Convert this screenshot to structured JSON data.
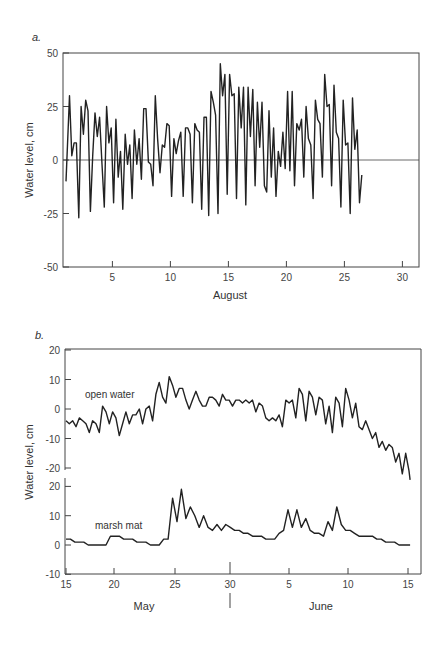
{
  "chart_data": [
    {
      "type": "line",
      "panel": "a.",
      "title": "",
      "xlabel": "August",
      "ylabel": "Water level, cm",
      "ylim": [
        -50,
        50
      ],
      "xlim": [
        1,
        31
      ],
      "y_ticks": [
        "50",
        "25",
        "0",
        "-25",
        "-50"
      ],
      "x_ticks": [
        "5",
        "10",
        "15",
        "20",
        "25",
        "30"
      ],
      "grid": false,
      "reference_line": 0,
      "series": [
        {
          "name": "water level",
          "x": [
            1.0,
            1.3,
            1.5,
            1.7,
            1.9,
            2.1,
            2.3,
            2.5,
            2.7,
            2.9,
            3.1,
            3.3,
            3.5,
            3.7,
            3.9,
            4.1,
            4.3,
            4.5,
            4.7,
            4.9,
            5.1,
            5.3,
            5.5,
            5.7,
            5.9,
            6.1,
            6.3,
            6.5,
            6.7,
            6.9,
            7.1,
            7.3,
            7.5,
            7.7,
            7.9,
            8.1,
            8.3,
            8.5,
            8.7,
            8.9,
            9.1,
            9.3,
            9.5,
            9.7,
            9.9,
            10.1,
            10.3,
            10.5,
            10.7,
            10.9,
            11.1,
            11.3,
            11.5,
            11.7,
            11.9,
            12.1,
            12.3,
            12.5,
            12.7,
            12.9,
            13.1,
            13.3,
            13.5,
            13.7,
            13.9,
            14.1,
            14.3,
            14.5,
            14.7,
            14.9,
            15.1,
            15.3,
            15.5,
            15.7,
            15.9,
            16.1,
            16.3,
            16.5,
            16.7,
            16.9,
            17.1,
            17.3,
            17.5,
            17.7,
            17.9,
            18.1,
            18.3,
            18.5,
            18.7,
            18.9,
            19.1,
            19.3,
            19.5,
            19.7,
            19.9,
            20.1,
            20.3,
            20.5,
            20.7,
            20.9,
            21.1,
            21.3,
            21.5,
            21.7,
            21.9,
            22.1,
            22.3,
            22.5,
            22.7,
            22.9,
            23.1,
            23.3,
            23.5,
            23.7,
            23.9,
            24.1,
            24.3,
            24.5,
            24.7,
            24.9,
            25.1,
            25.3,
            25.5,
            25.7,
            25.9,
            26.1,
            26.3,
            26.5,
            26.7,
            26.9,
            27.1,
            27.3,
            27.5,
            27.7,
            27.9,
            28.1,
            28.3,
            28.5,
            28.7,
            28.9,
            29.1,
            29.3,
            29.5,
            29.7,
            29.9,
            30.1,
            30.3,
            30.5,
            30.7,
            31.0
          ],
          "values": [
            -10,
            30,
            2,
            8,
            8,
            -27,
            25,
            12,
            28,
            23,
            -24,
            2,
            22,
            11,
            20,
            -2,
            -22,
            25,
            8,
            15,
            -20,
            19,
            -8,
            4,
            -23,
            12,
            -2,
            7,
            -18,
            14,
            -2,
            10,
            -9,
            24,
            24,
            -1,
            -2,
            -12,
            30,
            10,
            -6,
            7,
            6,
            17,
            16,
            -17,
            10,
            3,
            9,
            13,
            -17,
            15,
            15,
            12,
            -20,
            17,
            14,
            13,
            -23,
            20,
            20,
            -26,
            32,
            27,
            21,
            -25,
            45,
            30,
            40,
            -16,
            40,
            30,
            31,
            -18,
            34,
            15,
            34,
            -21,
            34,
            11,
            33,
            -12,
            27,
            6,
            27,
            -12,
            -15,
            23,
            -8,
            15,
            -17,
            4,
            -3,
            13,
            -4,
            32,
            -5,
            32,
            -12,
            17,
            14,
            19,
            -8,
            25,
            10,
            7,
            -18,
            28,
            19,
            17,
            -8,
            40,
            25,
            26,
            -12,
            35,
            13,
            10,
            -22,
            28,
            7,
            8,
            -25,
            29,
            5,
            14,
            -20,
            -7
          ]
        }
      ]
    },
    {
      "type": "line",
      "panel": "b.",
      "title": "",
      "xlabel": "",
      "x_group_labels": [
        "May",
        "June"
      ],
      "ylabel": "Water level, cm",
      "xlim": [
        "May 15",
        "June 15"
      ],
      "x_ticks": [
        "15",
        "20",
        "25",
        "30",
        "5",
        "10",
        "15"
      ],
      "grid": false,
      "subpanels": [
        {
          "name": "open water",
          "ylim": [
            -25,
            20
          ],
          "y_ticks": [
            "20",
            "10",
            "0",
            "-10",
            "-20"
          ]
        },
        {
          "name": "marsh mat",
          "ylim": [
            -10,
            22
          ],
          "y_ticks": [
            "20",
            "10",
            "0",
            "-10"
          ]
        }
      ],
      "series": [
        {
          "name": "open water",
          "x_day_index": [
            0,
            0.3,
            0.6,
            0.9,
            1.2,
            1.5,
            1.8,
            2.1,
            2.4,
            2.7,
            3.0,
            3.3,
            3.6,
            3.9,
            4.2,
            4.5,
            4.8,
            5.1,
            5.4,
            5.7,
            6.0,
            6.3,
            6.6,
            6.9,
            7.2,
            7.5,
            7.8,
            8.1,
            8.4,
            8.7,
            9.0,
            9.3,
            9.6,
            9.9,
            10.2,
            10.5,
            10.8,
            11.1,
            11.4,
            11.7,
            12.0,
            12.3,
            12.6,
            12.9,
            13.2,
            13.5,
            13.8,
            14.1,
            14.4,
            14.7,
            15.0,
            15.3,
            15.6,
            15.9,
            16.2,
            16.5,
            16.8,
            17.1,
            17.4,
            17.7,
            18.0,
            18.3,
            18.6,
            18.9,
            19.2,
            19.5,
            19.8,
            20.1,
            20.4,
            20.7,
            21.0,
            21.3,
            21.6,
            21.9,
            22.2,
            22.5,
            22.8,
            23.1,
            23.4,
            23.7,
            24.0,
            24.3,
            24.6,
            24.9,
            25.2,
            25.5,
            25.8,
            26.1,
            26.4,
            26.7,
            27.0,
            27.3,
            27.6,
            27.9,
            28.2,
            28.5,
            28.8,
            29.1,
            29.4,
            29.7,
            30.0,
            30.3,
            30.6,
            30.9,
            31.0
          ],
          "values": [
            -4,
            -5,
            -4,
            -6,
            -3,
            -4,
            -5,
            -8,
            -4,
            -5,
            -8,
            1,
            -1,
            -5,
            -1,
            -3,
            -9,
            -5,
            -1,
            -5,
            -2,
            -2,
            0,
            -5,
            0,
            1,
            -4,
            5,
            9,
            4,
            2,
            11,
            8,
            4,
            7,
            7,
            3,
            0,
            3,
            6,
            3,
            1,
            1,
            4,
            4,
            3,
            1,
            5,
            3,
            3,
            1,
            3,
            3,
            2,
            3,
            2,
            3,
            -1,
            2,
            1,
            -3,
            -4,
            -3,
            -4,
            -2,
            -6,
            3,
            2,
            3,
            -3,
            7,
            5,
            -4,
            6,
            4,
            -2,
            4,
            3,
            -5,
            1,
            -8,
            4,
            2,
            -6,
            7,
            3,
            -3,
            2,
            -6,
            -7,
            -4,
            -7,
            -10,
            -8,
            -13,
            -11,
            -14,
            -12,
            -13,
            -18,
            -15,
            -22,
            -15,
            -21,
            -24
          ]
        },
        {
          "name": "marsh mat",
          "x_day_index": [
            0,
            0.4,
            0.8,
            1.2,
            1.6,
            2.0,
            2.4,
            2.8,
            3.2,
            3.6,
            4.0,
            4.4,
            4.8,
            5.2,
            5.6,
            6.0,
            6.4,
            6.8,
            7.2,
            7.6,
            8.0,
            8.4,
            8.8,
            9.2,
            9.6,
            10.0,
            10.4,
            10.8,
            11.2,
            11.6,
            12.0,
            12.4,
            12.8,
            13.2,
            13.6,
            14.0,
            14.4,
            14.8,
            15.2,
            15.6,
            16.0,
            16.4,
            16.8,
            17.2,
            17.6,
            18.0,
            18.4,
            18.8,
            19.2,
            19.6,
            20.0,
            20.4,
            20.8,
            21.2,
            21.6,
            22.0,
            22.4,
            22.8,
            23.2,
            23.6,
            24.0,
            24.4,
            24.8,
            25.2,
            25.6,
            26.0,
            26.4,
            26.8,
            27.2,
            27.6,
            28.0,
            28.4,
            28.8,
            29.2,
            29.6,
            30.0,
            30.4,
            31.0
          ],
          "values": [
            2,
            2,
            1,
            1,
            1,
            0,
            0,
            0,
            0,
            0,
            3,
            3,
            3,
            2,
            2,
            2,
            1,
            1,
            1,
            0,
            0,
            0,
            2,
            2,
            16,
            8,
            19,
            9,
            13,
            10,
            6,
            10,
            6,
            5,
            7,
            5,
            7,
            6,
            5,
            5,
            4,
            4,
            3,
            3,
            3,
            2,
            2,
            2,
            4,
            5,
            12,
            6,
            12,
            6,
            9,
            5,
            4,
            4,
            3,
            8,
            5,
            13,
            7,
            5,
            5,
            4,
            3,
            3,
            3,
            3,
            2,
            2,
            1,
            1,
            1,
            0,
            0,
            0
          ]
        }
      ]
    }
  ],
  "panel_a": {
    "label": "a.",
    "ylabel": "Water level, cm",
    "xlabel": "August",
    "yticks": [
      "50",
      "25",
      "0",
      "-25",
      "-50"
    ],
    "xticks": [
      "5",
      "10",
      "15",
      "20",
      "25",
      "30"
    ]
  },
  "panel_b": {
    "label": "b.",
    "ylabel": "Water level, cm",
    "upper_series_label": "open water",
    "lower_series_label": "marsh mat",
    "upper_yticks": [
      "20",
      "10",
      "0",
      "-10",
      "-20"
    ],
    "lower_yticks": [
      "20",
      "10",
      "0",
      "-10"
    ],
    "xticks": [
      "15",
      "20",
      "25",
      "30",
      "5",
      "10",
      "15"
    ],
    "month_labels": [
      "May",
      "June"
    ]
  },
  "colors": {
    "line": "#222222",
    "axis": "#444444",
    "text": "#333333"
  }
}
